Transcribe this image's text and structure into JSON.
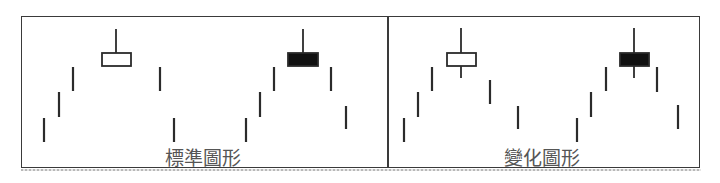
{
  "figure": {
    "type": "candlestick-pattern-diagram",
    "colors": {
      "line": "#2b2b2b",
      "frame": "#3a3a3a",
      "label": "#555555",
      "white_body_fill": "#ffffff",
      "black_body_fill": "#111111"
    },
    "panels": [
      {
        "id": "standard",
        "label": "標準圖形",
        "label_x": 203,
        "bars": [
          {
            "x": 44,
            "y1": 118,
            "y2": 142
          },
          {
            "x": 59,
            "y1": 92,
            "y2": 117
          },
          {
            "x": 73,
            "y1": 67,
            "y2": 91
          },
          {
            "x": 160,
            "y1": 67,
            "y2": 91
          },
          {
            "x": 174,
            "y1": 118,
            "y2": 142
          },
          {
            "x": 246,
            "y1": 118,
            "y2": 142
          },
          {
            "x": 260,
            "y1": 92,
            "y2": 117
          },
          {
            "x": 274,
            "y1": 67,
            "y2": 91
          },
          {
            "x": 331,
            "y1": 67,
            "y2": 91
          },
          {
            "x": 346,
            "y1": 106,
            "y2": 129
          }
        ],
        "candles": [
          {
            "kind": "white",
            "x": 102,
            "y": 53,
            "w": 29,
            "h": 13,
            "wick_x": 116,
            "wick_top": 29,
            "wick_bottom": 53
          },
          {
            "kind": "black",
            "x": 288,
            "y": 53,
            "w": 30,
            "h": 13,
            "wick_x": 303,
            "wick_top": 29,
            "wick_bottom": 53
          }
        ]
      },
      {
        "id": "variant",
        "label": "變化圖形",
        "label_x": 542,
        "bars": [
          {
            "x": 404,
            "y1": 118,
            "y2": 142
          },
          {
            "x": 418,
            "y1": 92,
            "y2": 117
          },
          {
            "x": 432,
            "y1": 67,
            "y2": 91
          },
          {
            "x": 490,
            "y1": 80,
            "y2": 104
          },
          {
            "x": 518,
            "y1": 106,
            "y2": 129
          },
          {
            "x": 577,
            "y1": 118,
            "y2": 142
          },
          {
            "x": 591,
            "y1": 92,
            "y2": 117
          },
          {
            "x": 606,
            "y1": 67,
            "y2": 91
          },
          {
            "x": 657,
            "y1": 67,
            "y2": 92
          },
          {
            "x": 678,
            "y1": 105,
            "y2": 129
          }
        ],
        "candles": [
          {
            "kind": "white",
            "x": 447,
            "y": 53,
            "w": 29,
            "h": 13,
            "wick_x": 461,
            "wick_top": 28,
            "wick_bottom": 78
          },
          {
            "kind": "black",
            "x": 620,
            "y": 53,
            "w": 29,
            "h": 13,
            "wick_x": 634,
            "wick_top": 28,
            "wick_bottom": 78
          }
        ]
      }
    ]
  }
}
